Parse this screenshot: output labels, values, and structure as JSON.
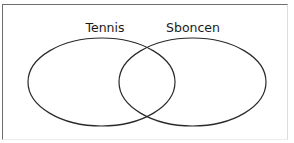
{
  "diagram": {
    "type": "venn",
    "sets": [
      {
        "id": "left",
        "label": "Tennis",
        "stroke": "#2a2a2a"
      },
      {
        "id": "right",
        "label": "Sboncen",
        "stroke": "#2a2a2a"
      }
    ],
    "colors": {
      "background": "#ffffff",
      "frame": "#6e6e6e",
      "stroke": "#2a2a2a",
      "text": "#1a1a1a"
    }
  }
}
